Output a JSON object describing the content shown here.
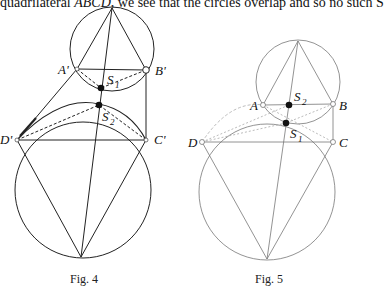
{
  "text": {
    "top_line_prefix": "quadrilateral ",
    "top_line_math": "ABCD",
    "top_line_suffix": ", we see that the circles overlap and so no such S"
  },
  "figures": [
    {
      "caption": "Fig. 4",
      "labels": {
        "A": "A'",
        "B": "B'",
        "C": "C'",
        "D": "D'",
        "S1": "S",
        "S1_sub": "1",
        "S2": "S",
        "S2_sub": "2"
      }
    },
    {
      "caption": "Fig. 5",
      "labels": {
        "A": "A",
        "B": "B",
        "C": "C",
        "D": "D",
        "S1": "S",
        "S1_sub": "1",
        "S2": "S",
        "S2_sub": "2"
      }
    }
  ]
}
